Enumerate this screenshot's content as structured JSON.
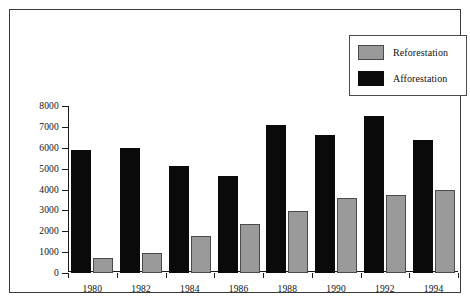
{
  "chart_data": {
    "type": "bar",
    "title": "",
    "subtitle": "",
    "xlabel": "",
    "ylabel": "",
    "categories": [
      "1980",
      "1982",
      "1984",
      "1986",
      "1988",
      "1990",
      "1992",
      "1994"
    ],
    "series": [
      {
        "name": "Reforestation",
        "color": "#9a9a9a",
        "values": [
          700,
          950,
          1750,
          2350,
          2950,
          3600,
          3750,
          4000
        ]
      },
      {
        "name": "Afforestation",
        "color": "#0a0a0a",
        "values": [
          5900,
          6000,
          5150,
          4650,
          7100,
          6600,
          7500,
          6350
        ]
      }
    ],
    "ylim": [
      0,
      8000
    ],
    "yticks": [
      0,
      1000,
      2000,
      3000,
      4000,
      5000,
      6000,
      7000,
      8000
    ],
    "ytick_labels": [
      "0",
      "1000",
      "2000",
      "3000",
      "4000",
      "5000",
      "6000",
      "7000",
      "8000"
    ],
    "grid": false,
    "legend_position": "top-right",
    "legend_entries": [
      "Reforestation",
      "Afforestation"
    ]
  }
}
